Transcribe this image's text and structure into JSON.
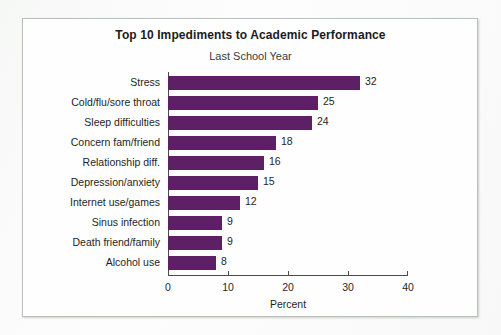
{
  "chart_data": {
    "type": "bar",
    "orientation": "horizontal",
    "title": "Top 10 Impediments to Academic Performance",
    "subtitle": "Last School Year",
    "xlabel": "Percent",
    "ylabel": "",
    "xlim": [
      0,
      40
    ],
    "xticks": [
      0,
      10,
      20,
      30,
      40
    ],
    "grid": false,
    "legend": false,
    "bar_color": "#5e2064",
    "categories": [
      "Stress",
      "Cold/flu/sore throat",
      "Sleep difficulties",
      "Concern fam/friend",
      "Relationship diff.",
      "Depression/anxiety",
      "Internet use/games",
      "Sinus infection",
      "Death friend/family",
      "Alcohol use"
    ],
    "values": [
      32,
      25,
      24,
      18,
      16,
      15,
      12,
      9,
      9,
      8
    ],
    "data_labels": [
      "32",
      "25",
      "24",
      "18",
      "16",
      "15",
      "12",
      "9",
      "9",
      "8"
    ]
  },
  "ghost_text": {
    "line1": "the very top of the same",
    "line2": "students report that",
    "line3": "are more likely to be",
    "line4": "Sources of Stress",
    "line5": "as stressful over the",
    "line6": "is more or less stress than"
  }
}
